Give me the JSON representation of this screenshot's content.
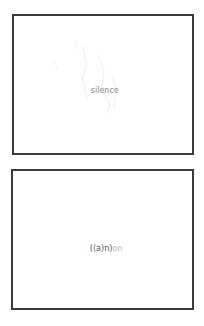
{
  "cards": [
    {
      "label": "silence"
    },
    {
      "label_main": "((a)n)",
      "label_tail": "on"
    }
  ],
  "colors": {
    "border": "#3a3a3a",
    "background": "#ffffff",
    "label1": "#8a8a8a",
    "label2": "#555555",
    "label2_tail": "#b5b5b5"
  }
}
